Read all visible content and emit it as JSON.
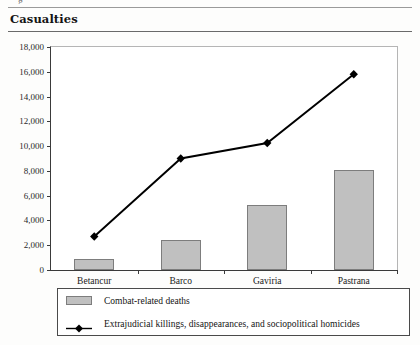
{
  "figure": {
    "clipped_text_above": "g",
    "header_title": "Casualties"
  },
  "chart_data": {
    "type": "bar",
    "title": "Casualties",
    "xlabel": "",
    "ylabel": "",
    "ylim": [
      0,
      18000
    ],
    "ytick_labels": [
      "18,000",
      "16,000",
      "14,000",
      "12,000",
      "10,000",
      "8,000",
      "6,000",
      "4,000",
      "2,000",
      "0"
    ],
    "ytick_values": [
      18000,
      16000,
      14000,
      12000,
      10000,
      8000,
      6000,
      4000,
      2000,
      0
    ],
    "grid": false,
    "legend_position": "bottom",
    "categories": [
      "Betancur",
      "Barco",
      "Gaviria",
      "Pastrana"
    ],
    "series": [
      {
        "name": "Combat-related deaths",
        "type": "bar",
        "values": [
          900,
          2450,
          5250,
          8100
        ],
        "color": "#c0c0c0"
      },
      {
        "name": "Extrajudicial killings, disappearances, and sociopolitical homicides",
        "type": "line",
        "values": [
          2700,
          9000,
          10250,
          15800
        ],
        "color": "#000000",
        "marker": "diamond"
      }
    ]
  },
  "legend": {
    "items": [
      {
        "label": "Combat-related deaths",
        "marker": "bar-swatch"
      },
      {
        "label": "Extrajudicial killings, disappearances, and sociopolitical homicides",
        "marker": "line-diamond"
      }
    ]
  }
}
